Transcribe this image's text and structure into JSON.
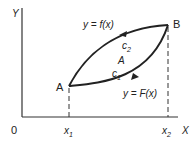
{
  "diagram": {
    "axes": {
      "y_label": "Y",
      "x_label": "X",
      "origin_label": "0"
    },
    "x_ticks": [
      {
        "base": "x",
        "sub": "1"
      },
      {
        "base": "x",
        "sub": "2"
      }
    ],
    "points": {
      "A": "A",
      "B": "B"
    },
    "curves": {
      "upper": {
        "label": "y = f(x)",
        "path_name": "c",
        "path_sub": "2"
      },
      "lower": {
        "label": "y = F(x)",
        "path_name": "c",
        "path_sub": "1"
      }
    },
    "region_label": "A",
    "colors": {
      "line": "#222222",
      "background": "#ffffff"
    }
  }
}
